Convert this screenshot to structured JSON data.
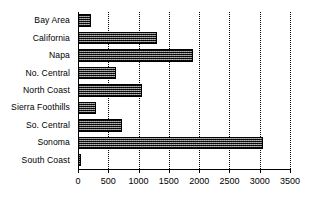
{
  "chart_data": {
    "type": "bar",
    "orientation": "horizontal",
    "title": "",
    "subtitle": "",
    "xlabel": "",
    "ylabel": "",
    "categories": [
      "Bay Area",
      "California",
      "Napa",
      "No. Central",
      "North Coast",
      "Sierra Foothills",
      "So. Central",
      "Sonoma",
      "South Coast"
    ],
    "values": [
      210,
      1310,
      1900,
      630,
      1060,
      295,
      720,
      3060,
      45
    ],
    "xlim": [
      0,
      3500
    ],
    "xticks": [
      0,
      500,
      1000,
      1500,
      2000,
      2500,
      3000,
      3500
    ],
    "xtick_labels": [
      "0",
      "500",
      "1000",
      "1500",
      "2000",
      "2500",
      "3000",
      "3500"
    ],
    "grid": "vertical-dotted",
    "legend": "none",
    "bar_fill": "#000000",
    "bar_pattern": "cross-hatch-dither",
    "axis_color": "#000000",
    "background": "#ffffff"
  }
}
